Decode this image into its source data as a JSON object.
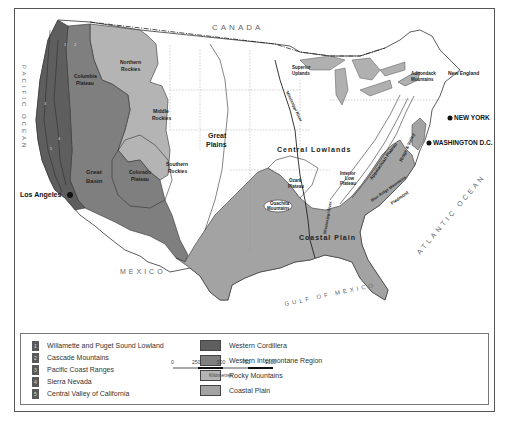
{
  "map": {
    "countries": {
      "north": "CANADA",
      "south": "MEXICO"
    },
    "water_bodies": {
      "pacific": "PACIFIC OCEAN",
      "atlantic": "ATLANTIC OCEAN",
      "gulf": "GULF OF MEXICO"
    },
    "regions": [
      {
        "id": "columbia-plateau",
        "label_lines": [
          "Columbia",
          "Plateau"
        ]
      },
      {
        "id": "northern-rockies",
        "label_lines": [
          "Northern",
          "Rockies"
        ]
      },
      {
        "id": "middle-rockies",
        "label_lines": [
          "Middle",
          "Rockies"
        ]
      },
      {
        "id": "southern-rockies",
        "label_lines": [
          "Southern",
          "Rockies"
        ]
      },
      {
        "id": "colorado-plateau",
        "label_lines": [
          "Colorado",
          "Plateau"
        ]
      },
      {
        "id": "great-basin",
        "label_lines": [
          "Great",
          "Basin"
        ]
      },
      {
        "id": "great-plains",
        "label_lines": [
          "Great",
          "Plains"
        ]
      },
      {
        "id": "central-lowlands",
        "label_lines": [
          "Central Lowlands"
        ]
      },
      {
        "id": "superior-uplands",
        "label_lines": [
          "Superior",
          "Uplands"
        ]
      },
      {
        "id": "ozark-plateau",
        "label_lines": [
          "Ozark",
          "Plateau"
        ]
      },
      {
        "id": "ouachita-mountains",
        "label_lines": [
          "Ouachita",
          "Mountains"
        ]
      },
      {
        "id": "interior-low-plateau",
        "label_lines": [
          "Interior",
          "Low",
          "Plateau"
        ]
      },
      {
        "id": "appalachian-plateau",
        "label_lines": [
          "Appalachian Plateau"
        ]
      },
      {
        "id": "ridge-valley",
        "label_lines": [
          "Ridge & Valley"
        ]
      },
      {
        "id": "blue-ridge",
        "label_lines": [
          "Blue Ridge Mountains"
        ]
      },
      {
        "id": "piedmont",
        "label_lines": [
          "Piedmont"
        ]
      },
      {
        "id": "adirondack",
        "label_lines": [
          "Adirondack",
          "Mountains"
        ]
      },
      {
        "id": "new-england",
        "label_lines": [
          "New England"
        ]
      },
      {
        "id": "coastal-plain",
        "label_lines": [
          "Coastal Plain"
        ]
      }
    ],
    "rivers": [
      {
        "id": "mississippi-upper",
        "label": "Mississippi River"
      },
      {
        "id": "mississippi-lower",
        "label": "Mississippi River"
      }
    ],
    "cities": [
      {
        "id": "los-angeles",
        "label": "Los Angeles"
      },
      {
        "id": "new-york",
        "label": "NEW YORK"
      },
      {
        "id": "washington",
        "label": "WASHINGTON D.C."
      }
    ],
    "pacific_numbers": [
      "1",
      "2",
      "3",
      "4",
      "5"
    ]
  },
  "legend": {
    "numbered": [
      {
        "num": "1",
        "label": "Willamette and Puget Sound Lowland"
      },
      {
        "num": "2",
        "label": "Cascade Mountains"
      },
      {
        "num": "3",
        "label": "Pacific Coast Ranges"
      },
      {
        "num": "4",
        "label": "Sierra Nevada"
      },
      {
        "num": "5",
        "label": "Central Valley of California"
      }
    ],
    "categories": [
      {
        "label": "Western Cordillera",
        "color": "#5e5e5e"
      },
      {
        "label": "Western Intermontane Region",
        "color": "#7f7f7f"
      },
      {
        "label": "Rocky Mountains",
        "color": "#b4b4b4"
      },
      {
        "label": "Coastal Plain",
        "color": "#a3a3a3"
      }
    ],
    "scale": {
      "ticks": [
        "0",
        "250",
        "500",
        "750",
        "1000"
      ],
      "unit": "Kilometres"
    }
  },
  "colors": {
    "western_cordillera": "#5e5e5e",
    "intermontane": "#7f7f7f",
    "rockies": "#b4b4b4",
    "coastal_plain": "#a3a3a3",
    "lakes": "#b0b0b0",
    "land": "#ffffff",
    "border": "#333333"
  }
}
